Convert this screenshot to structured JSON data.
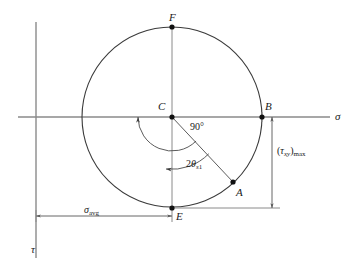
{
  "figure": {
    "background_color": "#ffffff",
    "stroke_color": "#3a3a3a",
    "axis_color": "#8a8a8a",
    "text_color": "#1a1a1a"
  },
  "axes": {
    "horizontal": {
      "name": "sigma-axis",
      "label": "σ",
      "label_x": 335,
      "label_y": 117,
      "y": 117,
      "x_start": 18,
      "x_end": 330
    },
    "vertical": {
      "name": "tau-axis",
      "label": "τ",
      "label_x": 31,
      "label_y": 249,
      "x": 36,
      "y_start": 22,
      "y_end": 258
    }
  },
  "circle": {
    "center_x": 172,
    "center_y": 117,
    "radius": 90
  },
  "points": [
    {
      "id": "F",
      "label": "F",
      "x": 172,
      "y": 27,
      "label_x": 169,
      "label_y": 12
    },
    {
      "id": "C",
      "label": "C",
      "x": 172,
      "y": 117,
      "label_x": 158,
      "label_y": 101
    },
    {
      "id": "B",
      "label": "B",
      "x": 262,
      "y": 117,
      "label_x": 265,
      "label_y": 101
    },
    {
      "id": "A",
      "label": "A",
      "x": 233,
      "y": 182,
      "label_x": 236,
      "label_y": 187
    },
    {
      "id": "E",
      "label": "E",
      "x": 172,
      "y": 208,
      "label_x": 176,
      "label_y": 211
    }
  ],
  "angles": [
    {
      "id": "ninety",
      "name": "angle-90",
      "label": "90°",
      "label_x": 190,
      "label_y": 122,
      "arc_radius": 34,
      "from_deg": 45,
      "to_deg": 135
    },
    {
      "id": "two-theta-s1",
      "name": "angle-2-theta-s1",
      "label_prefix": "2",
      "label_symbol": "θ",
      "label_subscript": "s",
      "label_subsubscript": "1",
      "label_x": 186,
      "label_y": 159,
      "arc_radius": 52,
      "from_deg": 45,
      "to_deg": 90
    }
  ],
  "dimensions": [
    {
      "id": "sigma-avg",
      "name": "dimension-sigma-avg",
      "label_symbol": "σ",
      "label_subscript": "avg",
      "orientation": "horizontal",
      "y": 216,
      "x_start": 36,
      "x_end": 172,
      "label_x": 84,
      "label_y": 210
    },
    {
      "id": "tau-xy-max",
      "name": "dimension-tau-xy-max",
      "label_open": "(",
      "label_symbol": "τ",
      "label_subscript": "xy",
      "label_close": ")",
      "label_subscript2": "max",
      "orientation": "vertical",
      "x": 272,
      "y_start": 117,
      "y_end": 208,
      "label_x": 277,
      "label_y": 152
    }
  ],
  "radius_line": {
    "name": "radius-line-CA",
    "from": "C",
    "to": "A"
  },
  "extension_lines": {
    "e_horizontal": {
      "name": "extension-line-E",
      "y": 208,
      "x_start": 172,
      "x_end": 280
    },
    "vertical_diameter": {
      "name": "vertical-diameter-FE",
      "x": 172,
      "y_start": 27,
      "y_end": 222
    }
  }
}
